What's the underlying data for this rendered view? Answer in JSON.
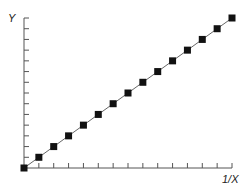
{
  "chart_data": {
    "type": "line",
    "title": "",
    "xlabel": "1/X",
    "ylabel": "Y",
    "x": [
      0,
      1,
      2,
      3,
      4,
      5,
      6,
      7,
      8,
      9,
      10,
      11,
      12,
      13,
      14
    ],
    "series": [
      {
        "name": "Y vs 1/X",
        "values": [
          0,
          1,
          2,
          3,
          4,
          5,
          6,
          7,
          8,
          9,
          10,
          11,
          12,
          13,
          14
        ],
        "marker": "square",
        "line": true
      }
    ],
    "xlim": [
      0,
      14
    ],
    "ylim": [
      0,
      14
    ],
    "x_ticks": 14,
    "y_ticks": 14,
    "tick_labels": false,
    "grid": false,
    "legend": "none"
  },
  "colors": {
    "axis": "#555555",
    "line": "#666666",
    "marker": "#111111"
  }
}
